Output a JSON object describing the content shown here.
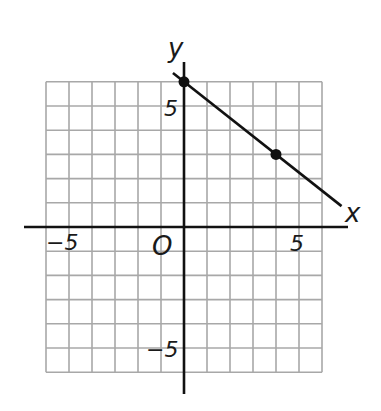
{
  "chart_data": {
    "type": "line",
    "title": "",
    "xlabel": "x",
    "ylabel": "y",
    "origin_label": "O",
    "xlim": [
      -6,
      6
    ],
    "ylim": [
      -6,
      6
    ],
    "grid": true,
    "grid_step": 1,
    "x_ticks_labeled": [
      {
        "value": -5,
        "label": "−5"
      },
      {
        "value": 5,
        "label": "5"
      }
    ],
    "y_ticks_labeled": [
      {
        "value": 5,
        "label": "5"
      },
      {
        "value": -5,
        "label": "−5"
      }
    ],
    "series": [
      {
        "name": "line",
        "points": [
          {
            "x": 0,
            "y": 6
          },
          {
            "x": 4,
            "y": 3
          }
        ],
        "slope": -0.75,
        "y_intercept": 6,
        "equation": "y = -3/4 x + 6",
        "marked_points": [
          {
            "x": 0,
            "y": 6
          },
          {
            "x": 4,
            "y": 3
          }
        ]
      }
    ],
    "legend": null
  },
  "labels": {
    "x_axis": "x",
    "y_axis": "y",
    "origin": "O",
    "x_tick_neg5": "−5",
    "x_tick_pos5": "5",
    "y_tick_pos5": "5",
    "y_tick_neg5": "−5"
  },
  "colors": {
    "grid": "#a8a8a8",
    "axis": "#111111",
    "line": "#111111",
    "point": "#111111"
  }
}
